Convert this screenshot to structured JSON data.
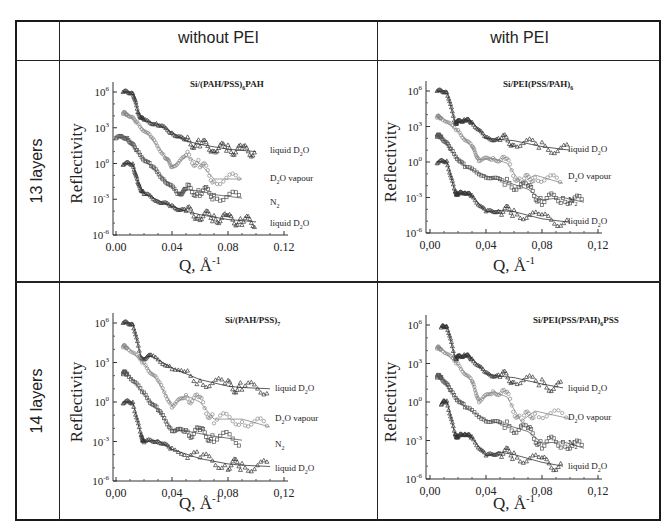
{
  "table": {
    "column_headers": [
      "",
      "without PEI",
      "with PEI"
    ],
    "row_headers": [
      "13 layers",
      "14 layers"
    ]
  },
  "panels": [
    {
      "id": "13-without",
      "title": "Si/(PAH/PSS)",
      "title_sub": "6",
      "title_tail": "PAH",
      "ylabel": "Reflectivity",
      "xlabel": "Q, Å",
      "xlabel_sup": "-1",
      "xticks": [
        "0.00",
        "0.04",
        "0.08",
        "0.12"
      ],
      "yticks": [
        "10^6",
        "10^3",
        "10^0",
        "10^-3",
        "10^-6"
      ],
      "curve_labels": [
        "liquid D2O",
        "D2O vapour",
        "N2",
        "liquid D2O"
      ]
    },
    {
      "id": "13-with",
      "title": "Si/PEI(PSS/PAH)",
      "title_sub": "6",
      "title_tail": "",
      "ylabel": "Reflectivity",
      "xlabel": "Q, Å",
      "xlabel_sup": "-1",
      "xticks": [
        "0,00",
        "0,04",
        "0,08",
        "0,12"
      ],
      "yticks": [
        "10^6",
        "10^3",
        "10^0",
        "10^-3",
        "10^-6"
      ],
      "curve_labels": [
        "liquid D2O",
        "D2O vapour",
        "N2",
        "liquid D2O"
      ]
    },
    {
      "id": "14-without",
      "title": "Si/(PAH/PSS)",
      "title_sub": "7",
      "title_tail": "",
      "ylabel": "Reflectivity",
      "xlabel": "Q, Å",
      "xlabel_sup": "-1",
      "xticks": [
        "0,00",
        "0,04",
        "0,08",
        "0,12"
      ],
      "yticks": [
        "10^6",
        "10^3",
        "10^0",
        "10^-3",
        "10^-6"
      ],
      "curve_labels": [
        "liquid D2O",
        "D2O vapour",
        "N2",
        "liquid D2O"
      ]
    },
    {
      "id": "14-with",
      "title": "Si/PEI(PSS/PAH)",
      "title_sub": "6",
      "title_tail": "PSS",
      "ylabel": "Reflectivity",
      "xlabel": "Q, Å",
      "xlabel_sup": "-1",
      "xticks": [
        "0,00",
        "0,04",
        "0,08",
        "0,12"
      ],
      "yticks": [
        "10^6",
        "10^3",
        "10^0",
        "10^-3",
        "10^-6"
      ],
      "curve_labels": [
        "liquid D2O",
        "D2O vapour",
        "N2",
        "liquid D2O"
      ]
    }
  ],
  "chart_data": [
    {
      "type": "scatter",
      "title": "Si/(PAH/PSS)6PAH",
      "panel": "13 layers, without PEI",
      "xlabel": "Q, Å^-1",
      "ylabel": "Reflectivity (log, offset curves)",
      "xlim": [
        0,
        0.12
      ],
      "ylim_log10": [
        -6,
        6
      ],
      "xticks": [
        0.0,
        0.04,
        0.08,
        0.12
      ],
      "yticks_log10": [
        6,
        3,
        0,
        -3,
        -6
      ],
      "series": [
        {
          "name": "liquid D2O (top)",
          "x": [
            0.005,
            0.012,
            0.016,
            0.02,
            0.03,
            0.04,
            0.05,
            0.06,
            0.07,
            0.08,
            0.09,
            0.1
          ],
          "log10_y": [
            6,
            6,
            4.2,
            3.6,
            3.3,
            2.6,
            1.9,
            1.6,
            1.4,
            1.2,
            1.1,
            1.0
          ]
        },
        {
          "name": "D2O vapour",
          "x": [
            0.005,
            0.008,
            0.015,
            0.025,
            0.035,
            0.04,
            0.05,
            0.06,
            0.07,
            0.09
          ],
          "log10_y": [
            4.2,
            4.2,
            3.4,
            2.2,
            0.6,
            -0.3,
            0.6,
            0.0,
            -1.3,
            -1.3
          ]
        },
        {
          "name": "N2",
          "x": [
            0.0,
            0.008,
            0.015,
            0.025,
            0.035,
            0.045,
            0.05,
            0.06,
            0.07,
            0.09
          ],
          "log10_y": [
            2.2,
            2.2,
            1.0,
            -0.2,
            -1.4,
            -2.6,
            -2.2,
            -2.3,
            -2.6,
            -2.9
          ]
        },
        {
          "name": "liquid D2O (bottom)",
          "x": [
            0.005,
            0.012,
            0.016,
            0.02,
            0.03,
            0.04,
            0.05,
            0.06,
            0.07,
            0.08,
            0.09,
            0.1
          ],
          "log10_y": [
            0,
            0,
            -1.8,
            -2.5,
            -3.1,
            -3.6,
            -4.0,
            -4.3,
            -4.5,
            -4.7,
            -4.8,
            -4.9
          ]
        }
      ]
    },
    {
      "type": "scatter",
      "title": "Si/PEI(PSS/PAH)6",
      "panel": "13 layers, with PEI",
      "xlabel": "Q, Å^-1",
      "ylabel": "Reflectivity (log, offset curves)",
      "xlim": [
        0,
        0.12
      ],
      "ylim_log10": [
        -6,
        6
      ],
      "xticks": [
        0.0,
        0.04,
        0.08,
        0.12
      ],
      "yticks_log10": [
        6,
        3,
        0,
        -3,
        -6
      ],
      "series": [
        {
          "name": "liquid D2O (top)",
          "x": [
            0.005,
            0.012,
            0.018,
            0.02,
            0.025,
            0.03,
            0.04,
            0.05,
            0.06,
            0.08,
            0.1
          ],
          "log10_y": [
            6,
            6,
            3.3,
            3.4,
            3.6,
            3.4,
            2.0,
            1.9,
            1.8,
            1.3,
            1.0
          ]
        },
        {
          "name": "D2O vapour",
          "x": [
            0.005,
            0.008,
            0.02,
            0.03,
            0.035,
            0.045,
            0.055,
            0.065,
            0.075,
            0.095
          ],
          "log10_y": [
            3.8,
            3.8,
            2.6,
            1.3,
            0.2,
            0.3,
            -0.1,
            -1.8,
            -1.1,
            -1.8
          ]
        },
        {
          "name": "N2",
          "x": [
            0.005,
            0.008,
            0.015,
            0.025,
            0.04,
            0.055,
            0.07,
            0.08,
            0.095,
            0.11
          ],
          "log10_y": [
            2.2,
            2.2,
            1.0,
            -0.4,
            -1.2,
            -1.7,
            -2.3,
            -3.2,
            -3.0,
            -3.4
          ]
        },
        {
          "name": "liquid D2O (bottom)",
          "x": [
            0.005,
            0.012,
            0.018,
            0.02,
            0.025,
            0.03,
            0.04,
            0.05,
            0.06,
            0.08,
            0.1
          ],
          "log10_y": [
            0,
            0.1,
            -2.6,
            -2.7,
            -2.5,
            -2.9,
            -4.2,
            -4.1,
            -4.2,
            -4.8,
            -5.1
          ]
        }
      ]
    },
    {
      "type": "scatter",
      "title": "Si/(PAH/PSS)7",
      "panel": "14 layers, without PEI",
      "xlabel": "Q, Å^-1",
      "ylabel": "Reflectivity (log, offset curves)",
      "xlim": [
        0,
        0.12
      ],
      "ylim_log10": [
        -6,
        6
      ],
      "xticks": [
        0.0,
        0.04,
        0.08,
        0.12
      ],
      "yticks_log10": [
        6,
        3,
        0,
        -3,
        -6
      ],
      "series": [
        {
          "name": "liquid D2O (top)",
          "x": [
            0.005,
            0.012,
            0.018,
            0.025,
            0.04,
            0.06,
            0.08,
            0.09,
            0.11
          ],
          "log10_y": [
            6,
            6,
            3.3,
            3.5,
            2.6,
            1.7,
            1.2,
            1.1,
            1.0
          ]
        },
        {
          "name": "D2O vapour",
          "x": [
            0.005,
            0.008,
            0.02,
            0.03,
            0.04,
            0.05,
            0.06,
            0.07,
            0.09,
            0.11
          ],
          "log10_y": [
            4.2,
            4.2,
            2.9,
            1.6,
            -0.3,
            0.5,
            0.0,
            -1.3,
            -1.3,
            -1.9
          ]
        },
        {
          "name": "N2",
          "x": [
            0.005,
            0.008,
            0.02,
            0.03,
            0.04,
            0.05,
            0.06,
            0.07,
            0.09
          ],
          "log10_y": [
            2.2,
            2.2,
            0.6,
            -0.6,
            -2.1,
            -2.2,
            -2.4,
            -2.6,
            -2.9
          ]
        },
        {
          "name": "liquid D2O (bottom)",
          "x": [
            0.005,
            0.012,
            0.018,
            0.02,
            0.03,
            0.04,
            0.06,
            0.08,
            0.09,
            0.11
          ],
          "log10_y": [
            0,
            0,
            -2.6,
            -3.0,
            -2.9,
            -3.6,
            -4.3,
            -4.7,
            -4.8,
            -4.9
          ]
        }
      ]
    },
    {
      "type": "scatter",
      "title": "Si/PEI(PSS/PAH)6PSS",
      "panel": "14 layers, with PEI",
      "xlabel": "Q, Å^-1",
      "ylabel": "Reflectivity (log, offset curves)",
      "xlim": [
        0,
        0.12
      ],
      "ylim_log10": [
        -6,
        6
      ],
      "xticks": [
        0.0,
        0.04,
        0.08,
        0.12
      ],
      "yticks_log10": [
        6,
        3,
        0,
        -3,
        -6
      ],
      "series": [
        {
          "name": "liquid D2O (top)",
          "x": [
            0.008,
            0.012,
            0.018,
            0.02,
            0.025,
            0.03,
            0.04,
            0.05,
            0.06,
            0.08,
            0.095
          ],
          "log10_y": [
            5.8,
            6,
            3.4,
            3.5,
            3.7,
            3.4,
            2.2,
            2.0,
            1.9,
            1.4,
            1.1
          ]
        },
        {
          "name": "D2O vapour",
          "x": [
            0.005,
            0.008,
            0.02,
            0.03,
            0.035,
            0.045,
            0.055,
            0.065,
            0.075,
            0.1
          ],
          "log10_y": [
            4.2,
            4.2,
            2.9,
            1.6,
            0.1,
            0.8,
            0.4,
            -1.5,
            -0.7,
            -1.3
          ]
        },
        {
          "name": "N2",
          "x": [
            0.005,
            0.008,
            0.015,
            0.025,
            0.04,
            0.055,
            0.07,
            0.08,
            0.095,
            0.11
          ],
          "log10_y": [
            2.0,
            2.0,
            0.8,
            -0.4,
            -1.4,
            -1.8,
            -2.3,
            -3.2,
            -3.1,
            -3.6
          ]
        },
        {
          "name": "liquid D2O (bottom)",
          "x": [
            0.008,
            0.012,
            0.018,
            0.02,
            0.025,
            0.03,
            0.04,
            0.05,
            0.06,
            0.08,
            0.095
          ],
          "log10_y": [
            -0.1,
            0.1,
            -2.6,
            -2.7,
            -2.4,
            -2.8,
            -4.2,
            -3.9,
            -4.1,
            -4.7,
            -5.0
          ]
        }
      ]
    }
  ]
}
